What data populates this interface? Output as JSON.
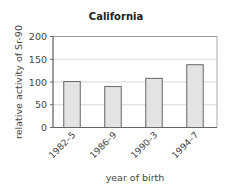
{
  "chart_data": {
    "type": "bar",
    "title": "California",
    "xlabel": "year of birth",
    "ylabel": "relative activity of Sr-90",
    "categories": [
      "1982–5",
      "1986–9",
      "1990–3",
      "1994–7"
    ],
    "values": [
      101,
      90,
      108,
      138
    ],
    "ylim": [
      0,
      200
    ],
    "yticks": [
      0,
      50,
      100,
      150,
      200
    ],
    "grid": true,
    "legend": null,
    "colors": {
      "bar_fill": "#e3e3e3",
      "bar_stroke": "#666666",
      "grid": "#d8d8d8",
      "axis": "#666666"
    }
  }
}
